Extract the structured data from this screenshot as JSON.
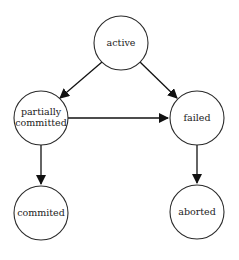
{
  "diagram": {
    "type": "state-transition",
    "nodes": [
      {
        "id": "active",
        "label_lines": [
          "active"
        ],
        "cx": 121,
        "cy": 43,
        "r": 27
      },
      {
        "id": "partially_committed",
        "label_lines": [
          "partially",
          "committed"
        ],
        "cx": 41,
        "cy": 118,
        "r": 27
      },
      {
        "id": "failed",
        "label_lines": [
          "failed"
        ],
        "cx": 197,
        "cy": 118,
        "r": 27
      },
      {
        "id": "commited",
        "label_lines": [
          "commited"
        ],
        "cx": 41,
        "cy": 213,
        "r": 27
      },
      {
        "id": "aborted",
        "label_lines": [
          "aborted"
        ],
        "cx": 197,
        "cy": 212,
        "r": 27
      }
    ],
    "edges": [
      {
        "from": "active",
        "to": "partially_committed"
      },
      {
        "from": "active",
        "to": "failed"
      },
      {
        "from": "partially_committed",
        "to": "failed"
      },
      {
        "from": "partially_committed",
        "to": "commited"
      },
      {
        "from": "failed",
        "to": "aborted"
      }
    ],
    "colors": {
      "stroke": "#2a2a2a",
      "arrow": "#111111",
      "background": "#ffffff"
    }
  }
}
